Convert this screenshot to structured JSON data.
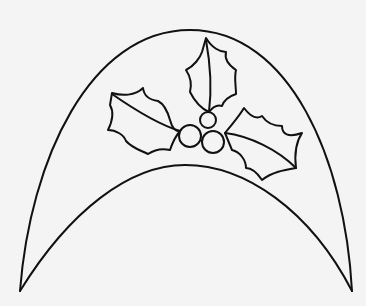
{
  "drawing": {
    "subject": "holly-decorated arch outline",
    "stroke_color": "#111111",
    "background_color": "#f4f4f4",
    "elements": [
      "outer-arch",
      "inner-arch",
      "holly-leaf-left",
      "holly-leaf-top",
      "holly-leaf-right",
      "berry-top",
      "berry-left",
      "berry-right"
    ]
  }
}
